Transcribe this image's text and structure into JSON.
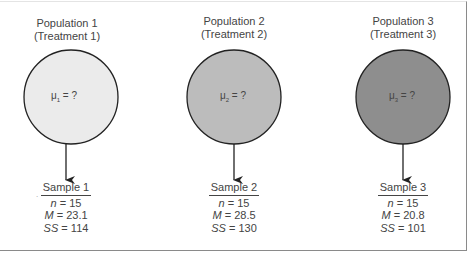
{
  "populations": [
    {
      "title": "Population 1",
      "subtitle": "(Treatment 1)",
      "mu_symbol": "μ",
      "mu_sub": "1",
      "mu_text": " = ?",
      "fill": "#ebebeb"
    },
    {
      "title": "Population 2",
      "subtitle": "(Treatment 2)",
      "mu_symbol": "μ",
      "mu_sub": "2",
      "mu_text": " = ?",
      "fill": "#bcbcbc"
    },
    {
      "title": "Population 3",
      "subtitle": "(Treatment 3)",
      "mu_symbol": "μ",
      "mu_sub": "3",
      "mu_text": " = ?",
      "fill": "#8e8e8e"
    }
  ],
  "samples": [
    {
      "name": "Sample 1",
      "n_label": "n",
      "n": "= 15",
      "m_label": "M",
      "m": "= 23.1",
      "ss_label": "SS",
      "ss": "= 114"
    },
    {
      "name": "Sample 2",
      "n_label": "n",
      "n": "= 15",
      "m_label": "M",
      "m": "= 28.5",
      "ss_label": "SS",
      "ss": "= 130"
    },
    {
      "name": "Sample 3",
      "n_label": "n",
      "n": "= 15",
      "m_label": "M",
      "m": "= 20.8",
      "ss_label": "SS",
      "ss": "= 101"
    }
  ],
  "colors": {
    "stroke": "#222222",
    "frame": "#8a8a8a"
  }
}
